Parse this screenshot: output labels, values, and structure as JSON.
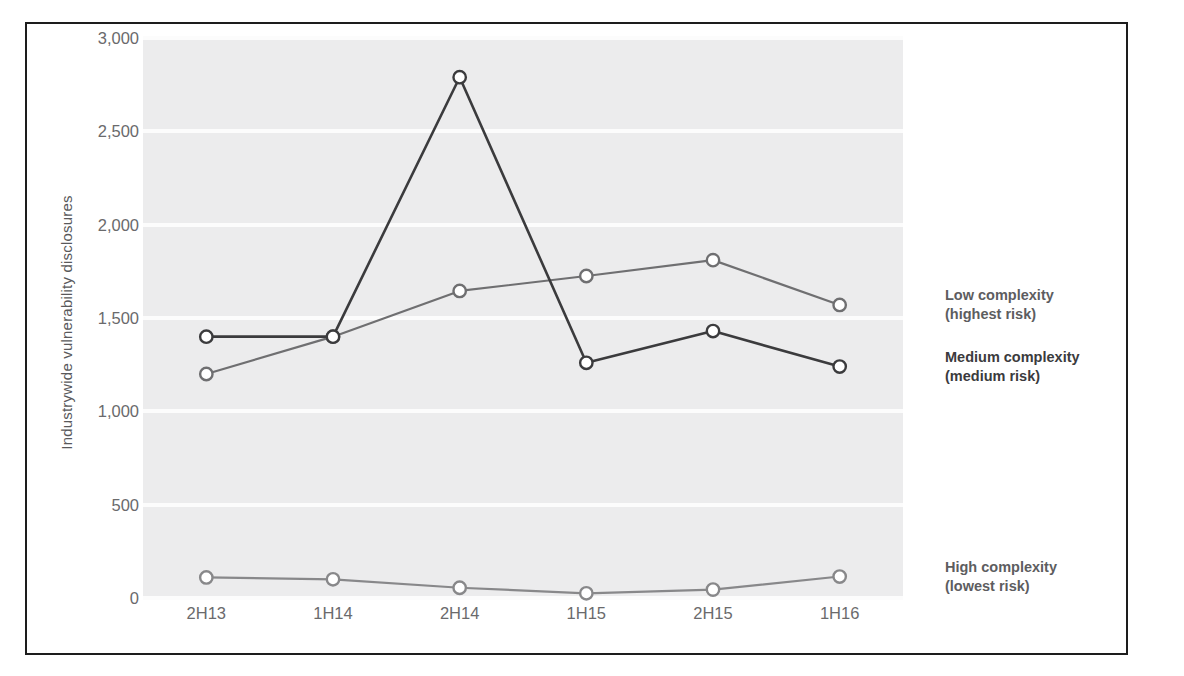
{
  "chart_data": {
    "type": "line",
    "title": "",
    "xlabel": "",
    "ylabel": "Industrywide vulnerability disclosures",
    "categories": [
      "2H13",
      "1H14",
      "2H14",
      "1H15",
      "2H15",
      "1H16"
    ],
    "ylim": [
      0,
      3000
    ],
    "yticks": [
      0,
      500,
      1000,
      1500,
      2000,
      2500,
      3000
    ],
    "ytick_labels": [
      "0",
      "500",
      "1,000",
      "1,500",
      "2,000",
      "2,500",
      "3,000"
    ],
    "grid": true,
    "legend_position": "right-inline-annotations",
    "series": [
      {
        "name": "Low complexity (highest risk)",
        "label_line1": "Low complexity",
        "label_line2": "(highest risk)",
        "color": "#6f6f71",
        "values": [
          1200,
          1400,
          1645,
          1725,
          1810,
          1570
        ]
      },
      {
        "name": "Medium complexity (medium risk)",
        "label_line1": "Medium complexity",
        "label_line2": "(medium risk)",
        "color": "#3b3b3d",
        "values": [
          1400,
          1400,
          2790,
          1260,
          1430,
          1240
        ]
      },
      {
        "name": "High complexity (lowest risk)",
        "label_line1": "High complexity",
        "label_line2": "(lowest risk)",
        "color": "#88888a",
        "values": [
          110,
          100,
          55,
          25,
          45,
          115
        ]
      }
    ]
  },
  "style": {
    "plot_background": "#ececed",
    "gridline_color": "#fcfcfc",
    "frame_color": "#1d1d1d",
    "tick_label_color": "#6a6a6c",
    "axis_title_color": "#59595b",
    "marker_fill": "#ffffff"
  }
}
